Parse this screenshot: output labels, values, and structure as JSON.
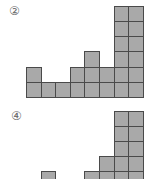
{
  "figures": [
    {
      "label": "②",
      "label_pos": [
        9,
        5
      ],
      "origin_x": 26,
      "base_y": 97,
      "cell_w": 14.6,
      "cell_h": 15.2,
      "column_heights": [
        2,
        1,
        1,
        2,
        3,
        2,
        6,
        6
      ]
    },
    {
      "label": "④",
      "label_pos": [
        11,
        110
      ],
      "origin_x": 26,
      "base_y": 186,
      "cell_w": 14.6,
      "cell_h": 15.0,
      "column_heights": [
        0,
        1,
        0,
        0,
        1,
        2,
        5,
        5
      ],
      "note_visible": "bottom of figure cropped"
    }
  ],
  "colors": {
    "cell_fill": "#a9a9a9",
    "cell_border": "#4a4a4a",
    "label": "#666666"
  }
}
